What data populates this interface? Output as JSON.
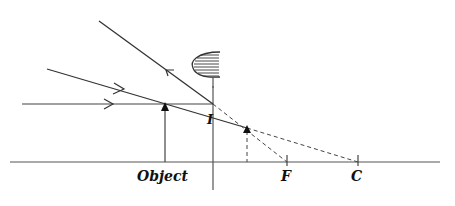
{
  "diagram": {
    "type": "convex-mirror-ray-diagram",
    "labels": {
      "object": "Object",
      "focus": "F",
      "center": "C",
      "image": "I"
    },
    "colors": {
      "line": "#333333",
      "axis": "#555555",
      "dashed": "#444444",
      "background": "#ffffff"
    }
  }
}
